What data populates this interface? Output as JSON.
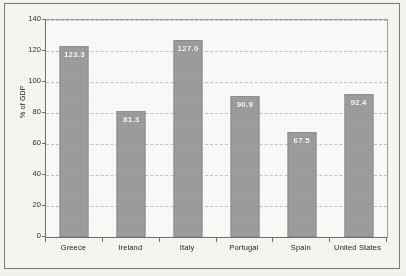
{
  "chart_data": {
    "type": "bar",
    "title": "",
    "subtitle": "",
    "xlabel": "",
    "ylabel": "% of GDP",
    "categories": [
      "Greece",
      "Ireland",
      "Italy",
      "Portugal",
      "Spain",
      "United States"
    ],
    "values": [
      123.3,
      81.3,
      127.0,
      90.9,
      67.5,
      92.4
    ],
    "value_labels": [
      "123.3",
      "81.3",
      "127.0",
      "90.9",
      "67.5",
      "92.4"
    ],
    "ylim": [
      0,
      140
    ],
    "yticks": [
      0,
      20,
      40,
      60,
      80,
      100,
      120,
      140
    ],
    "ytick_labels": [
      "0",
      "20",
      "40",
      "60",
      "80",
      "100",
      "120",
      "140"
    ],
    "grid": true,
    "grid_axis": "y",
    "grid_style": "dashed",
    "legend": false,
    "legend_position": "none",
    "series": [
      {
        "name": "",
        "values": [
          123.3,
          81.3,
          127.0,
          90.9,
          67.5,
          92.4
        ]
      }
    ],
    "colors": {
      "bar_fill": "#9d9d9c",
      "bar_edge": "#8e8e8d",
      "value_label": "#ffffff",
      "gridline": "#b9bcc4",
      "axis": "#6f6f6c",
      "plot_background": "#fbfaf8",
      "figure_background": "#f7f6f3",
      "text": "#232321"
    }
  }
}
